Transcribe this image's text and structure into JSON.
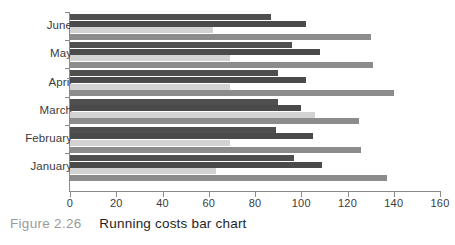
{
  "caption": {
    "label": "Figure 2.26",
    "text": "Running costs bar chart"
  },
  "chart_data": {
    "type": "bar",
    "orientation": "horizontal",
    "title": "Running costs bar chart",
    "xlabel": "",
    "ylabel": "",
    "xlim": [
      0,
      160
    ],
    "xticks": [
      0,
      20,
      40,
      60,
      80,
      100,
      120,
      140,
      160
    ],
    "xtick_labels": [
      "0",
      "20",
      "40",
      "60",
      "80",
      "100",
      "120",
      "140",
      "160"
    ],
    "grid": false,
    "legend": "none",
    "categories": [
      "June",
      "May",
      "April",
      "March",
      "February",
      "January"
    ],
    "series": [
      {
        "name": "series-1",
        "color": "#4f4f4f",
        "values": [
          87,
          96,
          90,
          90,
          89,
          97
        ]
      },
      {
        "name": "series-2",
        "color": "#4a4a4a",
        "values": [
          102,
          108,
          102,
          100,
          105,
          109
        ]
      },
      {
        "name": "series-3",
        "color": "#d2d2d2",
        "values": [
          62,
          69,
          69,
          106,
          69,
          63
        ]
      },
      {
        "name": "series-4",
        "color": "#8c8c8c",
        "values": [
          130,
          131,
          140,
          125,
          126,
          137
        ]
      }
    ]
  },
  "colors": {
    "axis": "#8a8a8a",
    "tick_label": "#3b3b3b",
    "caption_label": "#9a9a9a",
    "caption_text": "#1e1e1e",
    "background": "#ffffff"
  }
}
